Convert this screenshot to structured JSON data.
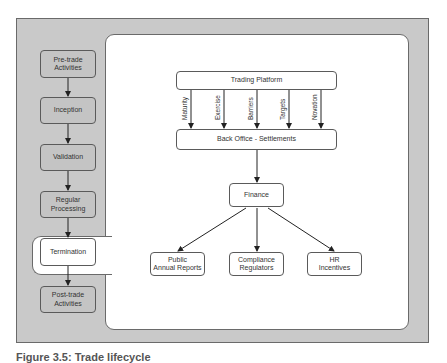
{
  "lifecycle": {
    "stages": [
      {
        "label": "Pre-trade\nActivities"
      },
      {
        "label": "Inception"
      },
      {
        "label": "Validation"
      },
      {
        "label": "Regular\nProcessing"
      },
      {
        "label": "Termination",
        "highlighted": true
      },
      {
        "label": "Post-trade\nActivities"
      }
    ]
  },
  "detail": {
    "trading_platform": "Trading Platform",
    "events": [
      "Maturity",
      "Exercise",
      "Barriers",
      "Targets",
      "Novation"
    ],
    "back_office": "Back Office - Settlements",
    "finance": "Finance",
    "outputs": [
      {
        "label": "Public\nAnnual Reports"
      },
      {
        "label": "Compliance\nRegulators"
      },
      {
        "label": "HR\nIncentives"
      }
    ]
  },
  "caption": "Figure 3.5: Trade lifecycle"
}
